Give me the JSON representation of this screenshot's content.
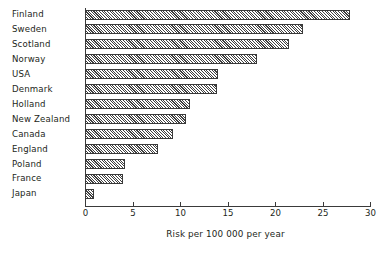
{
  "chart_data": {
    "type": "bar",
    "orientation": "horizontal",
    "title": "",
    "xlabel": "Risk per 100 000 per year",
    "ylabel": "",
    "xlim": [
      0,
      30
    ],
    "xticks": [
      0,
      5,
      10,
      15,
      20,
      25,
      30
    ],
    "xticklabels": [
      "0",
      "5",
      "10",
      "15",
      "20",
      "25",
      "30"
    ],
    "grid": false,
    "legend": false,
    "bar_style": {
      "fill": "hatched-diagonal",
      "edge_color": "#3a3a3a",
      "face_color": "#ffffff"
    },
    "categories": [
      "Finland",
      "Sweden",
      "Scotland",
      "Norway",
      "USA",
      "Denmark",
      "Holland",
      "New Zealand",
      "Canada",
      "England",
      "Poland",
      "France",
      "Japan"
    ],
    "values": [
      27.9,
      22.9,
      21.5,
      18.1,
      14.0,
      13.9,
      11.0,
      10.6,
      9.3,
      7.7,
      4.2,
      4.0,
      0.9
    ]
  }
}
